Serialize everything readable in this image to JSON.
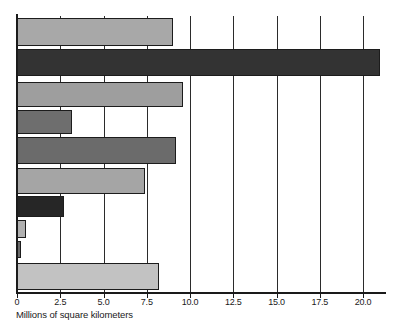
{
  "chart_data": {
    "type": "bar",
    "orientation": "horizontal",
    "title": "",
    "subtitle": "",
    "xlabel": "Millions of square kilometers",
    "ylabel": "",
    "xlim": [
      0,
      21.5
    ],
    "xticks": [
      0,
      2.5,
      5.0,
      7.5,
      10.0,
      12.5,
      15.0,
      17.5,
      20.0
    ],
    "xticklabels": [
      "0",
      "2.5",
      "5.0",
      "7.5",
      "10.0",
      "12.5",
      "15.0",
      "17.5",
      "20.0"
    ],
    "categories": [
      "",
      "",
      "",
      "",
      "",
      "",
      "",
      "",
      "",
      ""
    ],
    "yticklabels": [],
    "values": [
      9.0,
      21.0,
      9.6,
      3.2,
      9.2,
      7.4,
      2.7,
      0.5,
      0.25,
      8.2
    ],
    "bar_colors": [
      "#a8a8a8",
      "#333333",
      "#9e9e9e",
      "#6e6e6e",
      "#6b6b6b",
      "#a5a5a5",
      "#262626",
      "#b0b0b0",
      "#6a6a6a",
      "#c2c2c2"
    ],
    "bar_edge_color": "#1c1c1c",
    "grid": true,
    "grid_axis": "x",
    "grid_color": "#2b2b2b",
    "legend": null,
    "legend_position": "none",
    "annotations": [],
    "background_color": "#ffffff",
    "axis_color": "#1a1a1a"
  },
  "axis": {
    "x_title": "Millions of square kilometers"
  }
}
